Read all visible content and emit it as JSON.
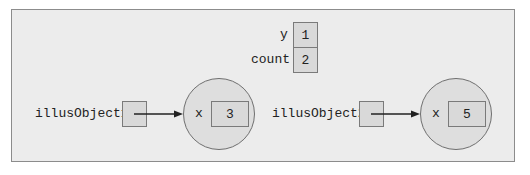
{
  "diagram": {
    "title": "",
    "static_variables": [
      {
        "name": "y",
        "value": "1"
      },
      {
        "name": "count",
        "value": "2"
      }
    ],
    "references": [
      {
        "name": "illusObject1",
        "object": {
          "field": "x",
          "value": "3"
        }
      },
      {
        "name": "illusObject2",
        "object": {
          "field": "x",
          "value": "5"
        }
      }
    ],
    "colors": {
      "frame_background": "#ececec",
      "frame_border": "#8c8c8c",
      "cell_fill": "#d9d9d9",
      "object_fill": "#dedede",
      "line": "#222222"
    }
  }
}
